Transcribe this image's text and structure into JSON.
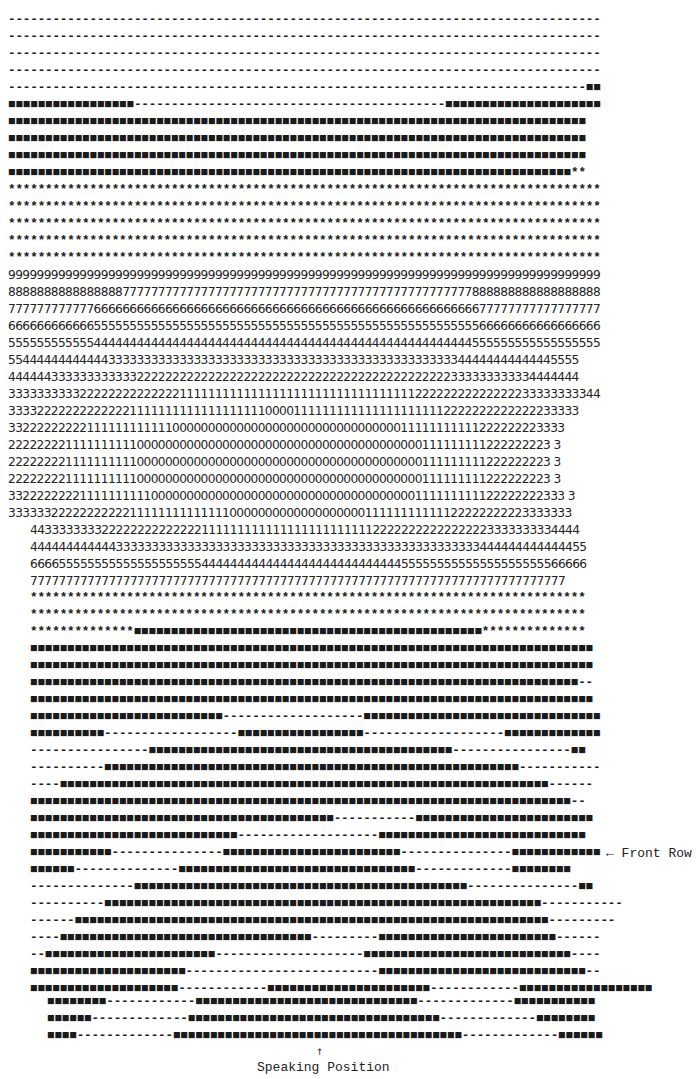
{
  "diagram": {
    "type": "seating-sound-map",
    "legend_glyphs": {
      "dash": "-",
      "block": "■",
      "star": "*",
      "digits": "0-9"
    },
    "upper_rows": [
      "--------------------------------------------------------------------------------",
      "--------------------------------------------------------------------------------",
      "--------------------------------------------------------------------------------",
      "--------------------------------------------------------------------------------",
      "------------------------------------------------------------------------------■■",
      "■■■■■■■■■■■■■■■■■------------------------------------------■■■■■■■■■■■■■■■■■■■■■",
      "■■■■■■■■■■■■■■■■■■■■■■■■■■■■■■■■■■■■■■■■■■■■■■■■■■■■■■■■■■■■■■■■■■■■■■■■■■■■■■",
      "■■■■■■■■■■■■■■■■■■■■■■■■■■■■■■■■■■■■■■■■■■■■■■■■■■■■■■■■■■■■■■■■■■■■■■■■■■■■■■",
      "■■■■■■■■■■■■■■■■■■■■■■■■■■■■■■■■■■■■■■■■■■■■■■■■■■■■■■■■■■■■■■■■■■■■■■■■■■■■■■",
      "■■■■■■■■■■■■■■■■■■■■■■■■■■■■■■■■■■■■■■■■■■■■■■■■■■■■■■■■■■■■■■■■■■■■■■■■■■■■**",
      "********************************************************************************",
      "********************************************************************************",
      "********************************************************************************",
      "********************************************************************************",
      "********************************************************************************",
      "********************************************************************************"
    ],
    "number_rows": [
      "99999999999999999999999999999999999999999999999999999999999999999999999999999999999",
      "88888888888888887777777777777777777777777777777777777777777777777888888888888888888",
      "77777777777766666666666666666666666666666666666666666666666666666677777777777777777",
      "66666666666655555555555555555555555555555555555555555555555555555566666666666666666",
      "55555555555544444444444444444444444444444444444444444444444444444555555555555555555",
      "55444444444444333333333333333333333333333333333333333333333333344444444444445555",
      "44444433333333333322222222222222222222222222222222222222222222333333333334444444",
      "33333333332222222222222211111111111111111111111111111111122222222222222233333333344",
      "33332222222222222111111111111111111100001111111111111111111112222222222222233333",
      "332222222221111111111110000000000000000000000000000000011111111111222222223333",
      "2222222211111111110000000000000000000000000000000000000000111111111222222223 3",
      "2222222211111111110000000000000000000000000000000000000000111111111222222223 3",
      "2222222211111111110000000000000000000000000000000000000000111111111222222223 3",
      "332222222211111111110000000000000000000000000000000000000111111111122222222333 3",
      "3333332222222222211111111111111000000000000000000011111111111122222222223333333"
    ],
    "number_rows_lower": [
      "44333333332222222222222211111111111111111111111122222222222222223333333334444",
      "444444444444333333333333333333333333333333333333333333333333333444444444444455",
      "666655555555555555555555444444444444444444444444444455555555555555555555566666",
      "777777777777777777777777777777777777777777777777777777777777777777777777777"
    ],
    "lower_rows": [
      "***************************************************************************",
      "***************************************************************************",
      "**************■■■■■■■■■■■■■■■■■■■■■■■■■■■■■■■■■■■■■■■■■■■■■■■**************",
      "■■■■■■■■■■■■■■■■■■■■■■■■■■■■■■■■■■■■■■■■■■■■■■■■■■■■■■■■■■■■■■■■■■■■■■■■■■■■",
      "■■■■■■■■■■■■■■■■■■■■■■■■■■■■■■■■■■■■■■■■■■■■■■■■■■■■■■■■■■■■■■■■■■■■■■■■■■■■",
      "■■■■■■■■■■■■■■■■■■■■■■■■■■■■■■■■■■■■■■■■■■■■■■■■■■■■■■■■■■■■■■■■■■■■■■■■■■--",
      "■■■■■■■■■■■■■■■■■■■■■■■■■■■■■■■■■■■■■■■■■■■■■■■■■■■■■■■■■■■■■■■■■■■■■■■■■■■■",
      "■■■■■■■■■■■■■■■■■■■■■■■■■■-------------------■■■■■■■■■■■■■■■■■■■■■■■■■■■■■■■■",
      "■■■■■■■■■■------------------■■■■■■■■■■■■■■■■■-------------------■■■■■■■■■■■■■",
      "----------------■■■■■■■■■■■■■■■■■■■■■■■■■■■■■■■■■■■■■■■■■----------------■■",
      "----------■■■■■■■■■■■■■■■■■■■■■■■■■■■■■■■■■■■■■■■■■■■■■■■■■■■■■■■■-----------",
      "----■■■■■■■■■■■■■■■■■■■■■■■■■■■■■■■■■■■■■■■■■■■■■■■■■■■■■■■■■■■■■■■■■■------",
      "■■■■■■■■■■■■■■■■■■■■■■■■■■■■■■■■■■■■■■■■■■■■■■■■■■■■■■■■■■■■■■■■■■■■■■■■■--",
      "■■■■■■■■■■■■■■■■■■■■■■■■■■■■■■■■■■■■■■■■■-----------■■■■■■■■■■■■■■■■■■■■■■■■",
      "■■■■■■■■■■■■■■■■■■■■■■■■■■■■-------------------■■■■■■■■■■■■■■■■■■■■■■■■■■■■",
      "■■■■■■■■■■■---------------■■■■■■■■■■■■■■■■■■■■■■■■---------------■■■■■■■■■■■■",
      "■■■■■■--------------■■■■■■■■■■■■■■■■■■■■■■■■■■■■■■■■-------------■■■■■■■■",
      "--------------■■■■■■■■■■■■■■■■■■■■■■■■■■■■■■■■■■■■■■■■■■■■■---------------■■",
      "----------■■■■■■■■■■■■■■■■■■■■■■■■■■■■■■■■■■■■■■■■■■■■■■■■■■■■■■■■■■■-----------",
      "------■■■■■■■■■■■■■■■■■■■■■■■■■■■■■■■■■■■■■■■■■■■■■■■■■■■■■■■■■■■■■■■■---------",
      "----■■■■■■■■■■■■■■■■■■■■■■■■■■■■■■■■■■---------■■■■■■■■■■■■■■■■■■■■■■■■------",
      "--■■■■■■■■■■■■■■■■■■■■■■■--------------------■■■■■■■■■■■■■■■■■■■■■■■■■■■■----",
      "■■■■■■■■■■■■■■■■■■■■■--------------------------■■■■■■■■■■■■■■■■■■■■■■■■■■■■--",
      "■■■■■■■■■■■■■■■■■■■■------------■■■■■■■■■■■■■■■■■■■■■■------------■■■■■■■■■■■■■■■■■■",
      "■■■■■■■■■■■■■■■■-------------■■■■■■■■■■■■■■■■■■■■■■■■■■■■■■-------------■■■■■■■■■■■■■■■■"
    ],
    "bottom_rows": [
      "■■■■■■■■------------■■■■■■■■■■■■■■■■■■■■■■■■■■■■■■-------------■■■■■■■■■■■",
      "■■■■■■-------------■■■■■■■■■■■■■■■■■■■■■■■■■■■■■■■■■■-------------■■■■■■■■",
      "■■■■-------------■■■■■■■■■■■■■■■■■■■■■■■■■■■■■■■■■■■■■■■-------------■■■■■■"
    ],
    "annotations": {
      "front_row": "← Front Row",
      "speaking_arrow": "↑",
      "speaking_position": "Speaking Position"
    }
  }
}
